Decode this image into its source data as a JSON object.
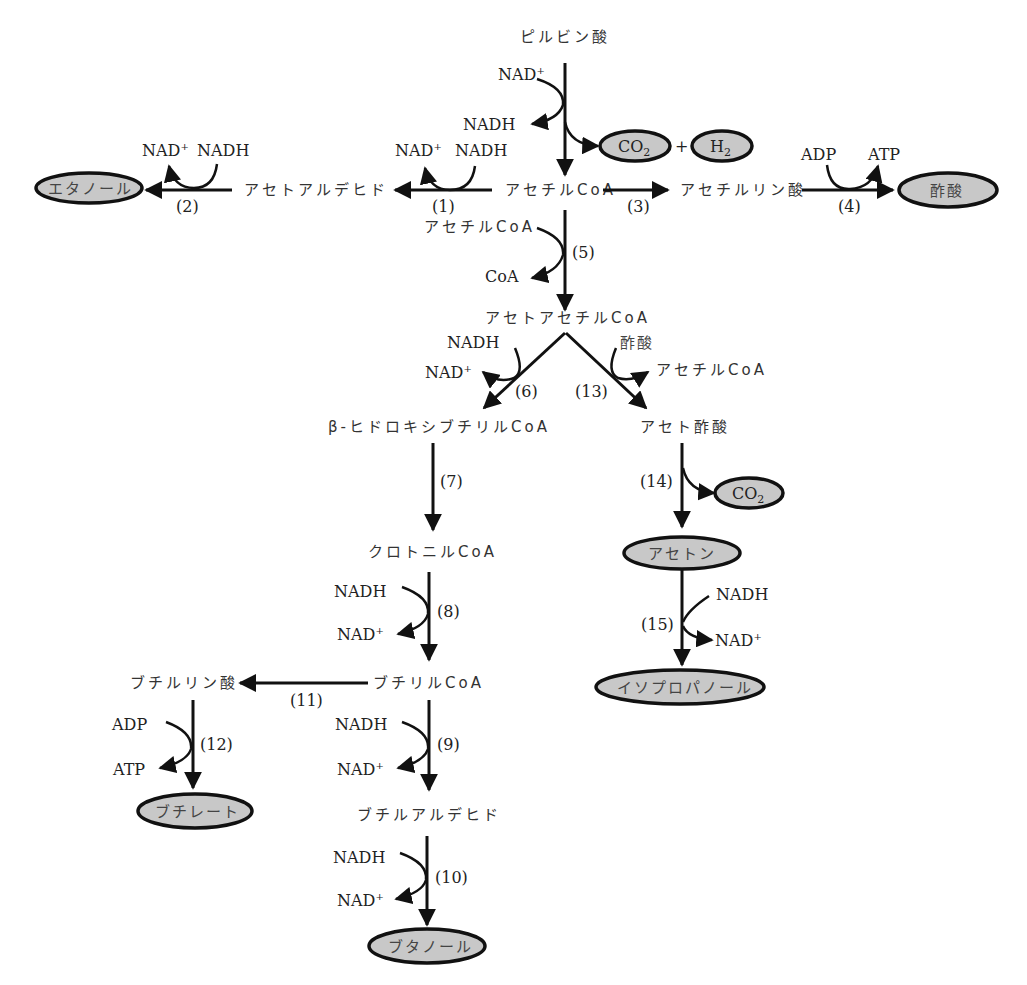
{
  "diagram": {
    "title": "",
    "nodes": {
      "pyruvate": "ピルビン酸",
      "acetyl_coa": "アセチルCoA",
      "acetaldehyde": "アセトアルデヒド",
      "ethanol": "エタノール",
      "acetyl_phosphate": "アセチルリン酸",
      "acetate": "酢酸",
      "co2_top": "CO",
      "h2": "H",
      "plus": "+",
      "acetoacetyl_coa": "アセトアセチルCoA",
      "hydroxybutyryl_coa": "β-ヒドロキシブチリルCoA",
      "acetoacetate": "アセト酢酸",
      "co2_mid": "CO",
      "acetone": "アセトン",
      "isopropanol": "イソプロパノール",
      "crotonyl_coa": "クロトニルCoA",
      "butyryl_coa": "ブチリルCoA",
      "butyryl_phosphate": "ブチルリン酸",
      "butyrate": "ブチレート",
      "butyraldehyde": "ブチルアルデヒド",
      "butanol": "ブタノール"
    },
    "subscript_2": "2",
    "cofactors": {
      "nad_plus": "NAD",
      "plus_sign": "+",
      "nadh": "NADH",
      "adp": "ADP",
      "atp": "ATP",
      "coa": "CoA",
      "acetyl_coa": "アセチルCoA",
      "acetate": "酢酸"
    },
    "steps": [
      "(1)",
      "(2)",
      "(3)",
      "(4)",
      "(5)",
      "(6)",
      "(7)",
      "(8)",
      "(9)",
      "(10)",
      "(11)",
      "(12)",
      "(13)",
      "(14)",
      "(15)"
    ],
    "colors": {
      "line": "#111111",
      "product_fill": "#c8c8c8",
      "text": "#222222"
    }
  }
}
